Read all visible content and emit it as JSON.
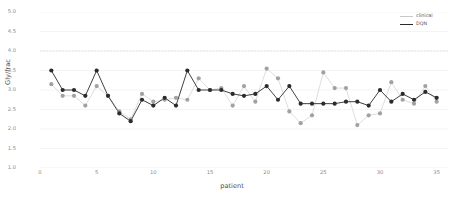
{
  "chart_data": {
    "type": "line",
    "title": "",
    "xlabel": "patient",
    "ylabel": "Gly/frac",
    "xlim": [
      0,
      36
    ],
    "ylim": [
      1.0,
      5.0
    ],
    "grid": true,
    "legend_position": "top-right",
    "x_ticks": [
      "0",
      "5",
      "10",
      "15",
      "20",
      "25",
      "30",
      "35"
    ],
    "x_tick_values": [
      0,
      5,
      10,
      15,
      20,
      25,
      30,
      35
    ],
    "y_ticks": [
      "1.0",
      "1.5",
      "2.0",
      "2.5",
      "3.0",
      "3.5",
      "4.0",
      "4.5",
      "5.0"
    ],
    "y_tick_values": [
      1.0,
      1.5,
      2.0,
      2.5,
      3.0,
      3.5,
      4.0,
      4.5,
      5.0
    ],
    "x": [
      1,
      2,
      3,
      4,
      5,
      6,
      7,
      8,
      9,
      10,
      11,
      12,
      13,
      14,
      15,
      16,
      17,
      18,
      19,
      20,
      21,
      22,
      23,
      24,
      25,
      26,
      27,
      28,
      29,
      30,
      31,
      32,
      33,
      34,
      35
    ],
    "series": [
      {
        "name": "clinical",
        "color": "#9a9a9a",
        "marker": "circle",
        "style": "scatter",
        "values": [
          3.15,
          2.85,
          2.85,
          2.6,
          3.1,
          2.85,
          2.45,
          2.25,
          2.9,
          2.7,
          2.75,
          2.8,
          2.75,
          3.3,
          3.0,
          3.05,
          2.6,
          3.1,
          2.7,
          3.55,
          3.3,
          2.45,
          2.15,
          2.35,
          3.45,
          3.05,
          3.05,
          2.1,
          2.35,
          2.4,
          3.2,
          2.75,
          2.65,
          3.1,
          2.7
        ]
      },
      {
        "name": "DQN",
        "color": "#2b2b2b",
        "marker": "circle",
        "style": "line+marker",
        "values": [
          3.5,
          3.0,
          3.0,
          2.85,
          3.5,
          2.85,
          2.4,
          2.2,
          2.75,
          2.6,
          2.8,
          2.6,
          3.5,
          3.0,
          3.0,
          3.0,
          2.9,
          2.85,
          2.9,
          3.1,
          2.75,
          3.1,
          2.65,
          2.65,
          2.65,
          2.65,
          2.7,
          2.7,
          2.6,
          3.0,
          2.7,
          2.9,
          2.75,
          2.95,
          2.8
        ]
      }
    ]
  },
  "legend": {
    "entries": [
      {
        "label": "clinical"
      },
      {
        "label": "DQN"
      }
    ]
  }
}
